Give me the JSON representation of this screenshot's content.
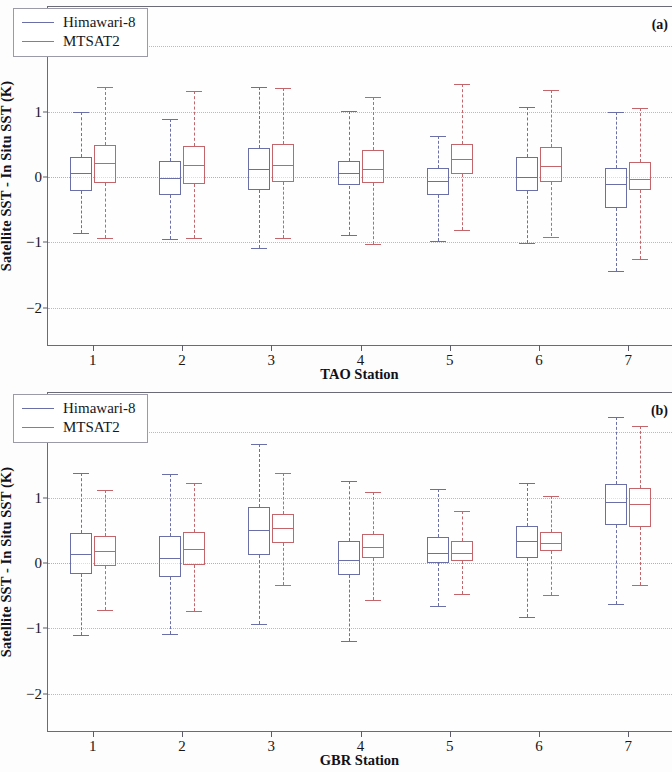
{
  "figure": {
    "y_axis_title": "Satellite SST - In Situ SST (K)",
    "y_ticks": [
      "2",
      "1",
      "0",
      "-1",
      "-2"
    ],
    "x_ticks": [
      "1",
      "2",
      "3",
      "4",
      "5",
      "6",
      "7"
    ],
    "legend": [
      {
        "label": "Himawari-8",
        "color": "#6b6fa8"
      },
      {
        "label": "MTSAT2",
        "color": "#c2666b"
      }
    ]
  },
  "panels": [
    {
      "tag": "(a)",
      "xlabel": "TAO Station"
    },
    {
      "tag": "(b)",
      "xlabel": "GBR Station"
    }
  ],
  "chart_data": [
    {
      "type": "box",
      "title": "(a)",
      "xlabel": "TAO Station",
      "ylabel": "Satellite SST - In Situ SST (K)",
      "ylim": [
        -2.6,
        2.6
      ],
      "yticks": [
        2,
        1,
        0,
        -1,
        -2
      ],
      "grid": true,
      "legend_position": "top-left",
      "categories": [
        "1",
        "2",
        "3",
        "4",
        "5",
        "6",
        "7"
      ],
      "series": [
        {
          "name": "Himawari-8",
          "color": "#6b6fa8",
          "boxes": [
            {
              "category": "1",
              "whisker_low": -0.86,
              "q1": -0.22,
              "median": 0.06,
              "q3": 0.31,
              "whisker_high": 1.0
            },
            {
              "category": "2",
              "whisker_low": -0.95,
              "q1": -0.27,
              "median": -0.02,
              "q3": 0.24,
              "whisker_high": 0.88
            },
            {
              "category": "3",
              "whisker_low": -1.09,
              "q1": -0.2,
              "median": 0.12,
              "q3": 0.44,
              "whisker_high": 1.37
            },
            {
              "category": "4",
              "whisker_low": -0.89,
              "q1": -0.13,
              "median": 0.06,
              "q3": 0.25,
              "whisker_high": 1.01
            },
            {
              "category": "5",
              "whisker_low": -0.98,
              "q1": -0.27,
              "median": -0.06,
              "q3": 0.14,
              "whisker_high": 0.62
            },
            {
              "category": "6",
              "whisker_low": -1.01,
              "q1": -0.22,
              "median": 0.0,
              "q3": 0.3,
              "whisker_high": 1.07
            },
            {
              "category": "7",
              "whisker_low": -1.44,
              "q1": -0.47,
              "median": -0.11,
              "q3": 0.14,
              "whisker_high": 1.0
            }
          ]
        },
        {
          "name": "MTSAT2",
          "color": "#c2666b",
          "boxes": [
            {
              "category": "1",
              "whisker_low": -0.93,
              "q1": -0.09,
              "median": 0.21,
              "q3": 0.49,
              "whisker_high": 1.37
            },
            {
              "category": "2",
              "whisker_low": -0.93,
              "q1": -0.11,
              "median": 0.18,
              "q3": 0.47,
              "whisker_high": 1.31
            },
            {
              "category": "3",
              "whisker_low": -0.93,
              "q1": -0.07,
              "median": 0.19,
              "q3": 0.5,
              "whisker_high": 1.36
            },
            {
              "category": "4",
              "whisker_low": -1.03,
              "q1": -0.09,
              "median": 0.12,
              "q3": 0.41,
              "whisker_high": 1.22
            },
            {
              "category": "5",
              "whisker_low": -0.81,
              "q1": 0.05,
              "median": 0.27,
              "q3": 0.51,
              "whisker_high": 1.42
            },
            {
              "category": "6",
              "whisker_low": -0.91,
              "q1": -0.07,
              "median": 0.17,
              "q3": 0.46,
              "whisker_high": 1.33
            },
            {
              "category": "7",
              "whisker_low": -1.26,
              "q1": -0.2,
              "median": -0.03,
              "q3": 0.23,
              "whisker_high": 1.05
            }
          ]
        }
      ]
    },
    {
      "type": "box",
      "title": "(b)",
      "xlabel": "GBR Station",
      "ylabel": "Satellite SST - In Situ SST (K)",
      "ylim": [
        -2.6,
        2.6
      ],
      "yticks": [
        2,
        1,
        0,
        -1,
        -2
      ],
      "grid": true,
      "legend_position": "top-left",
      "categories": [
        "1",
        "2",
        "3",
        "4",
        "5",
        "6",
        "7"
      ],
      "series": [
        {
          "name": "Himawari-8",
          "color": "#6b6fa8",
          "boxes": [
            {
              "category": "1",
              "whisker_low": -1.1,
              "q1": -0.17,
              "median": 0.14,
              "q3": 0.46,
              "whisker_high": 1.37
            },
            {
              "category": "2",
              "whisker_low": -1.09,
              "q1": -0.21,
              "median": 0.08,
              "q3": 0.42,
              "whisker_high": 1.36
            },
            {
              "category": "3",
              "whisker_low": -0.94,
              "q1": 0.12,
              "median": 0.51,
              "q3": 0.86,
              "whisker_high": 1.82
            },
            {
              "category": "4",
              "whisker_low": -1.2,
              "q1": -0.18,
              "median": 0.04,
              "q3": 0.33,
              "whisker_high": 1.25
            },
            {
              "category": "5",
              "whisker_low": -0.65,
              "q1": 0.0,
              "median": 0.15,
              "q3": 0.4,
              "whisker_high": 1.13
            },
            {
              "category": "6",
              "whisker_low": -0.82,
              "q1": 0.08,
              "median": 0.33,
              "q3": 0.56,
              "whisker_high": 1.23
            },
            {
              "category": "7",
              "whisker_low": -0.62,
              "q1": 0.58,
              "median": 0.93,
              "q3": 1.21,
              "whisker_high": 2.24
            }
          ]
        },
        {
          "name": "MTSAT2",
          "color": "#c2666b",
          "boxes": [
            {
              "category": "1",
              "whisker_low": -0.72,
              "q1": -0.05,
              "median": 0.18,
              "q3": 0.42,
              "whisker_high": 1.11
            },
            {
              "category": "2",
              "whisker_low": -0.74,
              "q1": -0.03,
              "median": 0.21,
              "q3": 0.48,
              "whisker_high": 1.23
            },
            {
              "category": "3",
              "whisker_low": -0.33,
              "q1": 0.31,
              "median": 0.54,
              "q3": 0.75,
              "whisker_high": 1.37
            },
            {
              "category": "4",
              "whisker_low": -0.57,
              "q1": 0.07,
              "median": 0.25,
              "q3": 0.44,
              "whisker_high": 1.09
            },
            {
              "category": "5",
              "whisker_low": -0.47,
              "q1": 0.03,
              "median": 0.16,
              "q3": 0.34,
              "whisker_high": 0.79
            },
            {
              "category": "6",
              "whisker_low": -0.49,
              "q1": 0.18,
              "median": 0.3,
              "q3": 0.47,
              "whisker_high": 1.03
            },
            {
              "category": "7",
              "whisker_low": -0.33,
              "q1": 0.55,
              "median": 0.9,
              "q3": 1.15,
              "whisker_high": 2.1
            }
          ]
        }
      ]
    }
  ]
}
